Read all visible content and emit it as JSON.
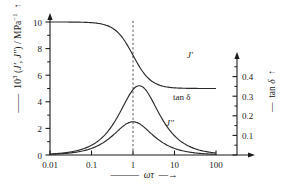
{
  "figure": {
    "y_axis_left": {
      "label_html": "10<sup>3</sup> (<i>J'</i>, <i>J''</i>) / MPa<sup>-1</sup>",
      "label_plain": "10^3 (J', J'') / MPa^-1",
      "ticks": [
        "0",
        "2",
        "4",
        "6",
        "8",
        "10"
      ],
      "minor_ticks": [
        1,
        3,
        5,
        7,
        9
      ],
      "range": [
        0,
        10
      ],
      "arrow": "up-arrow-icon"
    },
    "y_axis_right": {
      "label_html": "tan <i>&delta;</i>",
      "label_plain": "tan δ",
      "ticks": [
        "0.1",
        "0.2",
        "0.3",
        "0.4"
      ],
      "minor_ticks": [
        0.05,
        0.15,
        0.25,
        0.35,
        0.45
      ],
      "range": [
        0,
        0.5
      ],
      "arrow": "up-arrow-icon"
    },
    "x_axis": {
      "label_html": "<i>&omega;&tau;</i>",
      "label_plain": "ωτ",
      "ticks": [
        "0.01",
        "0.1",
        "1",
        "10",
        "100"
      ],
      "range": [
        0.01,
        100
      ],
      "scale": "log",
      "arrow": "right-arrow-icon"
    },
    "curve_labels": {
      "j_prime": "J'",
      "j_double_prime": "J''",
      "tan_delta": "tan δ"
    },
    "guide_line": {
      "at_x": "1",
      "style": "dashed-vertical"
    },
    "colors": {
      "axis": "#1a1a1a",
      "curve": "#2b2b2b",
      "guide": "#555555",
      "background": "#ffffff"
    }
  },
  "chart_data": {
    "type": "line",
    "title": "",
    "xlabel": "ωτ",
    "ylabel": "10^3 (J', J'') / MPa^-1",
    "ylabel_right": "tan δ",
    "xscale": "log",
    "xlim": [
      0.01,
      100
    ],
    "ylim": [
      0,
      10
    ],
    "ylim_right": [
      0,
      0.5
    ],
    "grid": false,
    "legend": "inline-curve-labels",
    "annotations": [
      {
        "text": "J'",
        "x": 6.0,
        "y": 5.6
      },
      {
        "text": "tan δ",
        "x": 9.0,
        "y": 3.9
      },
      {
        "text": "J''",
        "x": 4.0,
        "y": 2.0
      },
      {
        "text": "dashed vertical guide at ωτ = 1"
      }
    ],
    "x": [
      0.01,
      0.0158,
      0.0251,
      0.0398,
      0.0631,
      0.1,
      0.158,
      0.251,
      0.398,
      0.631,
      1.0,
      1.585,
      2.512,
      3.981,
      6.31,
      10.0,
      15.85,
      25.12,
      39.81,
      63.1,
      100.0
    ],
    "series": [
      {
        "name": "J'",
        "axis": "left",
        "units": "10^-3 MPa^-1",
        "values": [
          10.0,
          9.999,
          9.997,
          9.992,
          9.98,
          9.95,
          9.876,
          9.699,
          9.307,
          8.571,
          7.5,
          6.432,
          5.693,
          5.301,
          5.12,
          5.05,
          5.02,
          5.008,
          5.003,
          5.001,
          5.0
        ]
      },
      {
        "name": "J''",
        "axis": "left",
        "units": "10^-3 MPa^-1",
        "values": [
          0.025,
          0.04,
          0.063,
          0.099,
          0.157,
          0.248,
          0.388,
          0.598,
          0.886,
          1.215,
          2.5,
          1.215,
          0.886,
          0.598,
          0.388,
          0.248,
          0.157,
          0.099,
          0.063,
          0.04,
          0.025
        ]
      },
      {
        "name": "tan δ",
        "axis": "right",
        "units": "",
        "values": [
          0.0015,
          0.0024,
          0.0038,
          0.0059,
          0.0094,
          0.0149,
          0.0236,
          0.037,
          0.0572,
          0.0851,
          0.333,
          0.345,
          0.27,
          0.183,
          0.118,
          0.0745,
          0.0466,
          0.0292,
          0.0185,
          0.0117,
          0.0074
        ]
      }
    ]
  }
}
